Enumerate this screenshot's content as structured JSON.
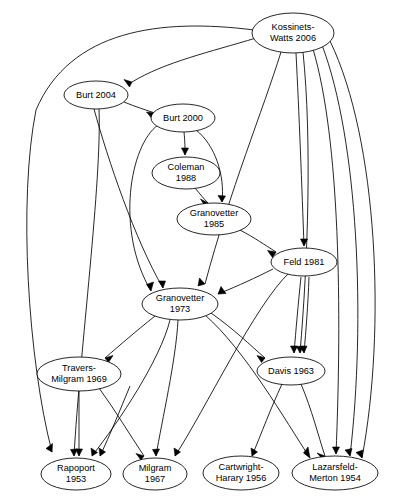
{
  "diagram": {
    "type": "directed-graph",
    "background_color": "#ffffff",
    "node_fill_color": "#ffffff",
    "node_stroke_color": "#000000",
    "edge_color": "#000000",
    "node_shape": "ellipse"
  },
  "nodes": [
    {
      "id": "kossinets_watts_2006",
      "label_line1": "Kossinets-",
      "label_line2": "Watts 2006",
      "cx": 293,
      "cy": 33,
      "rx": 41,
      "ry": 20,
      "lines": 2
    },
    {
      "id": "burt_2004",
      "label_line1": "Burt 2004",
      "label_line2": "",
      "cx": 96,
      "cy": 95,
      "rx": 32,
      "ry": 14,
      "lines": 1
    },
    {
      "id": "burt_2000",
      "label_line1": "Burt 2000",
      "label_line2": "",
      "cx": 183,
      "cy": 118,
      "rx": 32,
      "ry": 14,
      "lines": 1
    },
    {
      "id": "coleman_1988",
      "label_line1": "Coleman",
      "label_line2": "1988",
      "cx": 186,
      "cy": 173,
      "rx": 34,
      "ry": 16,
      "lines": 2
    },
    {
      "id": "granovetter_1985",
      "label_line1": "Granovetter",
      "label_line2": "1985",
      "cx": 214,
      "cy": 219,
      "rx": 37,
      "ry": 16,
      "lines": 2
    },
    {
      "id": "feld_1981",
      "label_line1": "Feld 1981",
      "label_line2": "",
      "cx": 304,
      "cy": 262,
      "rx": 33,
      "ry": 14,
      "lines": 1
    },
    {
      "id": "granovetter_1973",
      "label_line1": "Granovetter",
      "label_line2": "1973",
      "cx": 180,
      "cy": 304,
      "rx": 38,
      "ry": 16,
      "lines": 2
    },
    {
      "id": "travers_milgram_1969",
      "label_line1": "Travers-",
      "label_line2": "Milgram 1969",
      "cx": 79,
      "cy": 374,
      "rx": 42,
      "ry": 17,
      "lines": 2
    },
    {
      "id": "davis_1963",
      "label_line1": "Davis 1963",
      "label_line2": "",
      "cx": 291,
      "cy": 371,
      "rx": 34,
      "ry": 14,
      "lines": 1
    },
    {
      "id": "rapoport_1953",
      "label_line1": "Rapoport",
      "label_line2": "1953",
      "cx": 76,
      "cy": 474,
      "rx": 35,
      "ry": 16,
      "lines": 2
    },
    {
      "id": "milgram_1967",
      "label_line1": "Milgram",
      "label_line2": "1967",
      "cx": 155,
      "cy": 474,
      "rx": 32,
      "ry": 16,
      "lines": 2
    },
    {
      "id": "cartwright_harary_1956",
      "label_line1": "Cartwright-",
      "label_line2": "Harary 1956",
      "cx": 241,
      "cy": 473,
      "rx": 38,
      "ry": 17,
      "lines": 2
    },
    {
      "id": "lazarsfeld_merton_1954",
      "label_line1": "Lazarsfeld-",
      "label_line2": "Merton 1954",
      "cx": 335,
      "cy": 473,
      "rx": 43,
      "ry": 17,
      "lines": 2
    }
  ],
  "edges": [
    {
      "id": "e1",
      "from": "kossinets_watts_2006",
      "to": "burt_2004",
      "path": "M 256,38 C 210,52 165,62 132,82",
      "arrow": "132,82 124,79.5 129.5,87"
    },
    {
      "id": "e2",
      "from": "kossinets_watts_2006",
      "to": "rapoport_1953",
      "path": "M 254,30 C 160,18 70,30 36,110 C 18,200 28,360 52,452",
      "arrow": "52,452 52.5,443.5 46,448.5"
    },
    {
      "id": "e3",
      "from": "kossinets_watts_2006",
      "to": "granovetter_1973",
      "path": "M 281,52 C 263,110 230,190 205,284",
      "arrow": "205,284 199.5,278 198,286"
    },
    {
      "id": "e4",
      "from": "kossinets_watts_2006",
      "to": "feld_1981",
      "path": "M 296,53 C 299,110 302,190 304,246",
      "arrow": "304,246 300.5,239 307.5,239"
    },
    {
      "id": "e5",
      "from": "kossinets_watts_2006",
      "to": "davis_1963",
      "path": "M 303,52 C 312,140 308,260 300,353",
      "arrow": "300,353 296.5,346.5 303.5,346"
    },
    {
      "id": "e6",
      "from": "kossinets_watts_2006",
      "to": "lazarsfeld_merton_1954",
      "path": "M 313,49 C 340,140 342,310 336,454",
      "arrow": "336,454 332.5,447 339.5,447"
    },
    {
      "id": "e7",
      "from": "kossinets_watts_2006",
      "to": "lazarsfeld_merton_1954",
      "path": "M 322,45 C 358,140 366,320 350,456",
      "arrow": "350,456 345,450 352,448.5"
    },
    {
      "id": "e8",
      "from": "kossinets_watts_2006",
      "to": "lazarsfeld_merton_1954",
      "path": "M 330,41 C 378,140 386,330 362,458",
      "arrow": "362,458 356,452.5 363,450"
    },
    {
      "id": "e9",
      "from": "burt_2004",
      "to": "burt_2000",
      "path": "M 124,102 C 136,107 146,110 155,113",
      "arrow": "155,113 146.5,112 152,118.5"
    },
    {
      "id": "e10",
      "from": "burt_2004",
      "to": "granovetter_1973",
      "path": "M 94,109 C 108,160 135,240 163,288",
      "arrow": "163,288 158.5,281 165.5,281"
    },
    {
      "id": "e11",
      "from": "burt_2004",
      "to": "rapoport_1953",
      "path": "M 99,109 C 102,180 80,350 74,456",
      "arrow": "74,456 70.5,449.5 77.5,449"
    },
    {
      "id": "e12",
      "from": "burt_2000",
      "to": "coleman_1988",
      "path": "M 184,132 C 185,142 185,148 185,155",
      "arrow": "185,155 181.5,148 188.5,148"
    },
    {
      "id": "e13",
      "from": "burt_2000",
      "to": "granovetter_1985",
      "path": "M 196,130 C 215,145 225,175 222,202",
      "arrow": "222,202 218,195.5 225.5,196"
    },
    {
      "id": "e14",
      "from": "burt_2000",
      "to": "granovetter_1973",
      "path": "M 158,125 C 130,145 115,230 151,291",
      "arrow": "151,291 146.5,284.5 153.5,282"
    },
    {
      "id": "e15",
      "from": "coleman_1988",
      "to": "granovetter_1985",
      "path": "M 195,188 C 200,194 204,199 208,203",
      "arrow": "208,203 200.5,199 205,206"
    },
    {
      "id": "e16",
      "from": "granovetter_1985",
      "to": "feld_1981",
      "path": "M 240,230 C 255,238 265,245 276,252",
      "arrow": "276,252 267.5,250.5 272.5,257.5"
    },
    {
      "id": "e17",
      "from": "feld_1981",
      "to": "granovetter_1973",
      "path": "M 273,269 C 255,278 240,285 218,294",
      "arrow": "218,294 226,293.5 221,286.5"
    },
    {
      "id": "e18",
      "from": "feld_1981",
      "to": "davis_1963",
      "path": "M 301,277 C 298,305 296,330 294,353",
      "arrow": "294,353 290.5,346 297.5,346"
    },
    {
      "id": "e19",
      "from": "feld_1981",
      "to": "davis_1963",
      "path": "M 309,277 C 308,305 306,330 304,353",
      "arrow": "304,353 300,346.5 307,346"
    },
    {
      "id": "e20",
      "from": "feld_1981",
      "to": "milgram_1967",
      "path": "M 289,273 C 255,305 205,410 175,456",
      "arrow": "175,456 174,448 180.5,452"
    },
    {
      "id": "e21",
      "from": "granovetter_1973",
      "to": "travers_milgram_1969",
      "path": "M 155,316 C 135,332 120,345 105,358",
      "arrow": "105,358 113,355.5 108.5,362.5"
    },
    {
      "id": "e22",
      "from": "granovetter_1973",
      "to": "davis_1963",
      "path": "M 211,313 C 235,330 250,345 265,358",
      "arrow": "265,358 257,355.5 261.5,362.5"
    },
    {
      "id": "e23",
      "from": "granovetter_1973",
      "to": "rapoport_1953",
      "path": "M 170,320 C 160,360 120,420 92,456",
      "arrow": "92,456 91,448 97.5,452.5"
    },
    {
      "id": "e24",
      "from": "granovetter_1973",
      "to": "milgram_1967",
      "path": "M 178,320 C 176,360 162,420 156,456",
      "arrow": "156,456 152.5,449.5 159.5,449"
    },
    {
      "id": "e25",
      "from": "granovetter_1973",
      "to": "lazarsfeld_merton_1954",
      "path": "M 205,315 C 245,350 285,420 310,458",
      "arrow": "310,458 303.5,453 308,447"
    },
    {
      "id": "e26",
      "from": "travers_milgram_1969",
      "to": "rapoport_1953",
      "path": "M 79,391 C 79,415 79,438 79,456",
      "arrow": "79,456 75.5,449 82.5,449"
    },
    {
      "id": "e27",
      "from": "travers_milgram_1969",
      "to": "milgram_1967",
      "path": "M 99,388 C 115,410 130,435 144,456",
      "arrow": "144,456 136,453.5 141,460"
    },
    {
      "id": "e28",
      "from": "davis_1963",
      "to": "cartwright_harary_1956",
      "path": "M 282,384 C 270,410 262,432 252,456",
      "arrow": "252,456 251,448 257.5,452"
    },
    {
      "id": "e29",
      "from": "davis_1963",
      "to": "lazarsfeld_merton_1954",
      "path": "M 301,384 C 312,410 318,435 325,456",
      "arrow": "325,456 317,453 322.5,459"
    },
    {
      "id": "e30",
      "from": "milgram_1967_src",
      "to": "rapoport_1953",
      "path": "M 130,386 C 120,410 110,435 100,456",
      "arrow": "100,456 99,448 105.5,452"
    }
  ]
}
